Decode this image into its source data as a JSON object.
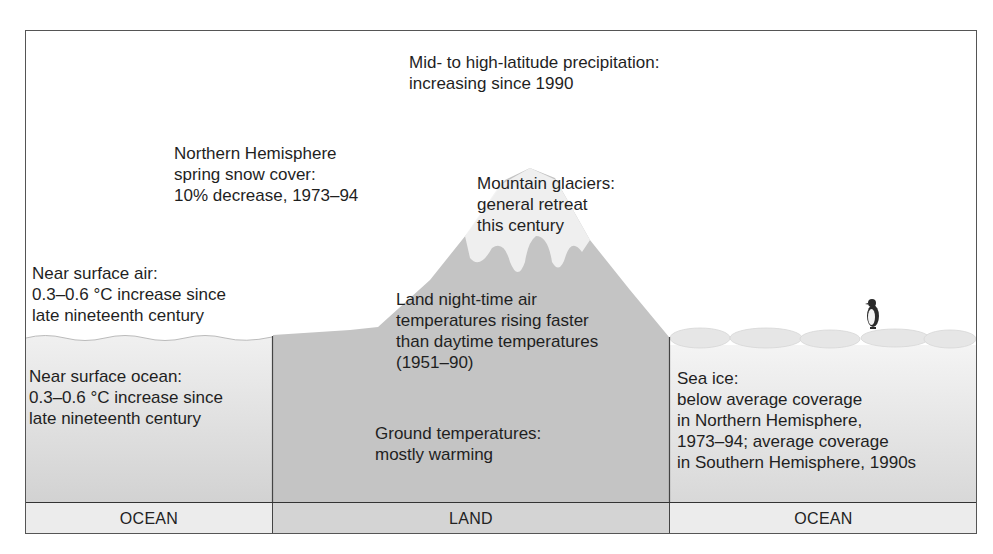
{
  "diagram": {
    "type": "climate-change-indicators-cross-section",
    "colors": {
      "ocean_fill": "#e2e2e2",
      "land_fill": "#c6c6c6",
      "snow": "#f3f3f3",
      "footer_ocean": "#ededed",
      "footer_land": "#d6d6d6",
      "border": "#444444"
    }
  },
  "annotations": {
    "precipitation": "Mid- to high-latitude precipitation:\nincreasing since 1990",
    "snow_cover": "Northern Hemisphere\nspring snow cover:\n10% decrease, 1973–94",
    "glaciers": "Mountain glaciers:\ngeneral retreat\nthis century",
    "surface_air": "Near surface air:\n0.3–0.6 °C increase since\nlate nineteenth century",
    "night_temps": "Land night-time air\ntemperatures rising faster\nthan daytime temperatures\n(1951–90)",
    "surface_ocean": "Near surface ocean:\n0.3–0.6 °C increase since\nlate nineteenth century",
    "ground_temps": "Ground temperatures:\nmostly warming",
    "sea_ice": "Sea ice:\nbelow average coverage\nin Northern Hemisphere,\n1973–94; average coverage\nin Southern Hemisphere, 1990s"
  },
  "footer": {
    "left": "OCEAN",
    "center": "LAND",
    "right": "OCEAN"
  },
  "icons": {
    "penguin": "penguin-icon"
  }
}
